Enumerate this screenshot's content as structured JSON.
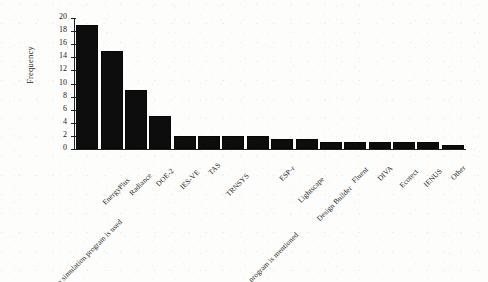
{
  "chart_data": {
    "type": "bar",
    "title": "",
    "subtitle": "",
    "xlabel": "",
    "ylabel": "Frequency",
    "ylim": [
      0,
      20
    ],
    "yticks": [
      0,
      2,
      4,
      6,
      8,
      10,
      12,
      14,
      16,
      18,
      20
    ],
    "grid": false,
    "legend": false,
    "legend_position": "none",
    "bar_color": "#0d0d0d",
    "categories": [
      "No simulation program is used",
      "EnergyPlus",
      "Radiance",
      "DOE-2",
      "IES-VE",
      "TAS",
      "TRNSYS",
      "No simulation program is mentioned",
      "ESP-r",
      "Lightscape",
      "Design Builder",
      "Fluent",
      "DIVA",
      "Ecotect",
      "IENUS",
      "Other"
    ],
    "values": [
      19,
      15,
      9,
      5,
      2,
      2,
      2,
      2,
      1.6,
      1.6,
      1.1,
      1.1,
      1.1,
      1.1,
      1.1,
      0.6
    ]
  },
  "axis": {
    "y_title": "Frequency",
    "tick_labels": [
      "0",
      "2",
      "4",
      "6",
      "8",
      "10",
      "12",
      "14",
      "16",
      "18",
      "20"
    ]
  }
}
